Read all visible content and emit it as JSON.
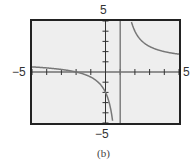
{
  "chart_data": {
    "type": "line",
    "title": "",
    "caption": "(b)",
    "function": "y = (x + 2) / (x - 1)",
    "xlabel": "",
    "ylabel": "",
    "xlim": [
      -5,
      5
    ],
    "ylim": [
      -5,
      5
    ],
    "xscale_ticks": 1,
    "yscale_ticks": 1,
    "x_tick_labels": {
      "min": "−5",
      "max": "5"
    },
    "y_tick_labels": {
      "min": "−5",
      "max": "5"
    },
    "grid": false,
    "vertical_asymptote": 1,
    "horizontal_asymptote": 1,
    "series": [
      {
        "name": "left branch",
        "x": [
          -5,
          -4,
          -3,
          -2,
          -1,
          -0.5,
          0,
          0.25,
          0.4,
          0.5
        ],
        "y": [
          0.5,
          0.4,
          0.25,
          0,
          -0.5,
          -1,
          -2,
          -3,
          -4,
          -5
        ]
      },
      {
        "name": "right branch",
        "x": [
          1.75,
          2,
          2.5,
          3,
          4,
          5
        ],
        "y": [
          5,
          4,
          3,
          2.5,
          2,
          1.75
        ]
      }
    ],
    "colors": {
      "curve": "#777777",
      "axes": "#333333",
      "frame": "#222222",
      "screen": "#eeeeee"
    }
  }
}
